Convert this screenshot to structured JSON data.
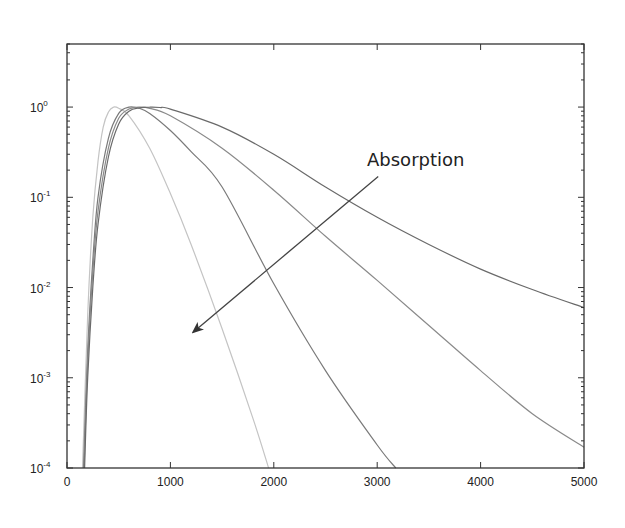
{
  "chart_data": {
    "type": "line",
    "title": "",
    "xlabel": "",
    "ylabel": "",
    "xscale": "linear",
    "yscale": "log",
    "xlim": [
      0,
      5000
    ],
    "ylim": [
      0.0001,
      5
    ],
    "grid": false,
    "legend": null,
    "x_ticks": [
      0,
      1000,
      2000,
      3000,
      4000,
      5000
    ],
    "x_tick_labels": [
      "0",
      "1000",
      "2000",
      "3000",
      "4000",
      "5000"
    ],
    "y_ticks": [
      0.0001,
      0.001,
      0.01,
      0.1,
      1
    ],
    "y_tick_labels": [
      {
        "base": "10",
        "exp": "-4"
      },
      {
        "base": "10",
        "exp": "-3"
      },
      {
        "base": "10",
        "exp": "-2"
      },
      {
        "base": "10",
        "exp": "-1"
      },
      {
        "base": "10",
        "exp": "0"
      }
    ],
    "series": [
      {
        "name": "curve-1",
        "color": "#c4c4c4",
        "x": [
          150,
          200,
          250,
          300,
          350,
          400,
          450,
          500,
          600,
          800,
          1000,
          1200,
          1500,
          1800,
          1950
        ],
        "y": [
          0.0001,
          0.005,
          0.06,
          0.25,
          0.6,
          0.88,
          1.0,
          0.97,
          0.8,
          0.35,
          0.11,
          0.03,
          0.0035,
          0.00035,
          0.0001
        ]
      },
      {
        "name": "curve-2",
        "color": "#7a7a7a",
        "x": [
          160,
          200,
          250,
          300,
          400,
          500,
          600,
          700,
          800,
          1000,
          1200,
          1500,
          2000,
          2500,
          3000,
          3180
        ],
        "y": [
          0.0001,
          0.002,
          0.02,
          0.1,
          0.45,
          0.85,
          1.0,
          0.97,
          0.85,
          0.55,
          0.32,
          0.13,
          0.011,
          0.0012,
          0.00018,
          0.0001
        ]
      },
      {
        "name": "curve-3",
        "color": "#8a8a8a",
        "x": [
          165,
          200,
          250,
          300,
          400,
          500,
          600,
          700,
          800,
          1000,
          1500,
          2000,
          2500,
          3000,
          3500,
          4000,
          4500,
          5000
        ],
        "y": [
          0.0001,
          0.0015,
          0.015,
          0.07,
          0.35,
          0.75,
          0.95,
          1.0,
          0.97,
          0.8,
          0.35,
          0.12,
          0.037,
          0.012,
          0.0038,
          0.0012,
          0.0004,
          0.00017
        ]
      },
      {
        "name": "curve-4",
        "color": "#6a6a6a",
        "x": [
          170,
          200,
          250,
          300,
          400,
          500,
          600,
          700,
          800,
          900,
          1000,
          1500,
          2000,
          2500,
          3000,
          3500,
          4000,
          4500,
          5000
        ],
        "y": [
          0.0001,
          0.001,
          0.01,
          0.05,
          0.28,
          0.65,
          0.9,
          0.98,
          1.0,
          0.99,
          0.95,
          0.6,
          0.3,
          0.13,
          0.06,
          0.03,
          0.016,
          0.0095,
          0.006
        ]
      }
    ],
    "annotations": [
      {
        "text": "Absorption",
        "type": "arrow",
        "arrow_from": {
          "x": 3010,
          "y": 0.17
        },
        "arrow_to": {
          "x": 1220,
          "y": 0.0032
        },
        "text_pos": {
          "x": 2900,
          "y": 0.4
        }
      }
    ]
  }
}
